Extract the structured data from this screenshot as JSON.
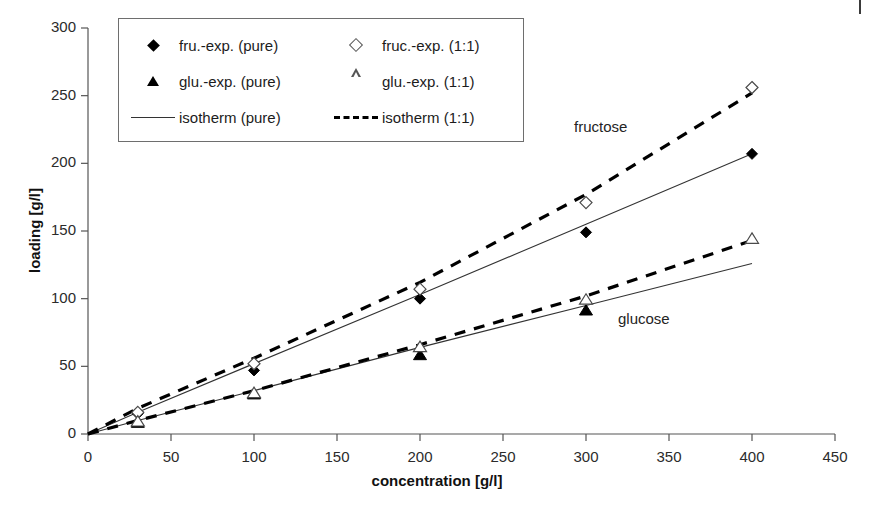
{
  "chart_data": {
    "type": "line",
    "title": "",
    "xlabel": "concentration [g/l]",
    "ylabel": "loading [g/l]",
    "xlim": [
      0,
      450
    ],
    "ylim": [
      0,
      300
    ],
    "xticks": [
      0,
      50,
      100,
      150,
      200,
      250,
      300,
      350,
      400,
      450
    ],
    "yticks": [
      0,
      50,
      100,
      150,
      200,
      250,
      300
    ],
    "grid": false,
    "legend_position": "upper-left",
    "annotations": [
      {
        "text": "fructose",
        "x": 295,
        "y": 212
      },
      {
        "text": "glucose",
        "x": 320,
        "y": 80
      }
    ],
    "series": [
      {
        "name": "fru.-exp. (pure)",
        "type": "scatter",
        "marker": "diamond-filled",
        "x": [
          30,
          100,
          200,
          300,
          400
        ],
        "y": [
          15,
          47,
          100,
          149,
          207
        ]
      },
      {
        "name": "fruc.-exp. (1:1)",
        "type": "scatter",
        "marker": "diamond-open",
        "x": [
          30,
          100,
          200,
          300,
          400
        ],
        "y": [
          16,
          52,
          107,
          171,
          256
        ]
      },
      {
        "name": "glu.-exp. (pure)",
        "type": "scatter",
        "marker": "triangle-filled",
        "x": [
          30,
          100,
          200,
          300
        ],
        "y": [
          8,
          29,
          58,
          91
        ]
      },
      {
        "name": "glu.-exp. (1:1)",
        "type": "scatter",
        "marker": "triangle-open",
        "x": [
          30,
          100,
          200,
          300,
          400
        ],
        "y": [
          9,
          30,
          64,
          99,
          144
        ]
      },
      {
        "name": "isotherm (pure) - fructose",
        "type": "line",
        "style": "solid",
        "x": [
          0,
          30,
          100,
          200,
          300,
          400
        ],
        "y": [
          0,
          16,
          52,
          103,
          155,
          207
        ]
      },
      {
        "name": "isotherm (1:1) - fructose",
        "type": "line",
        "style": "dashed",
        "x": [
          0,
          30,
          100,
          200,
          300,
          400
        ],
        "y": [
          0,
          19,
          56,
          112,
          177,
          252
        ]
      },
      {
        "name": "isotherm (pure) - glucose",
        "type": "line",
        "style": "solid",
        "x": [
          0,
          30,
          100,
          200,
          300,
          400
        ],
        "y": [
          0,
          10,
          32,
          64,
          95,
          126
        ]
      },
      {
        "name": "isotherm (1:1) - glucose",
        "type": "line",
        "style": "dashed",
        "x": [
          0,
          30,
          100,
          200,
          300,
          400
        ],
        "y": [
          0,
          10,
          32,
          66,
          102,
          143
        ]
      }
    ]
  },
  "legend": {
    "rows": [
      {
        "left": {
          "marker": "diamond-filled",
          "label": "fru.-exp. (pure)"
        },
        "right": {
          "marker": "diamond-open",
          "label": "fruc.-exp. (1:1)"
        }
      },
      {
        "left": {
          "marker": "triangle-filled",
          "label": "glu.-exp. (pure)"
        },
        "right": {
          "marker": "triangle-open",
          "label": "glu.-exp. (1:1)"
        }
      },
      {
        "left": {
          "marker": "line-solid",
          "label": "isotherm (pure)"
        },
        "right": {
          "marker": "line-dashed",
          "label": "isotherm (1:1)"
        }
      }
    ]
  },
  "axis": {
    "x_title": "concentration [g/l]",
    "y_title": "loading [g/l]",
    "x_tick_labels": [
      "0",
      "50",
      "100",
      "150",
      "200",
      "250",
      "300",
      "350",
      "400",
      "450"
    ],
    "y_tick_labels": [
      "0",
      "50",
      "100",
      "150",
      "200",
      "250",
      "300"
    ]
  },
  "colors": {
    "axis": "#555555",
    "line_solid": "#333333",
    "line_dashed": "#000000",
    "text": "#1c1c1c",
    "background": "#ffffff"
  }
}
